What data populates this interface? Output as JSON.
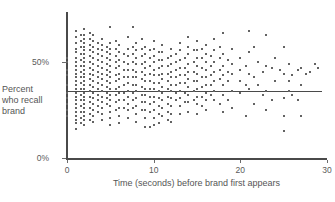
{
  "chart_data": {
    "type": "scatter",
    "title": "",
    "xlabel": "Time (seconds) before brand first appears",
    "ylabel": "Percent who recall brand",
    "xlim": [
      0,
      30
    ],
    "ylim": [
      0,
      75
    ],
    "grid": false,
    "legend": null,
    "xticks": [
      0,
      10,
      20,
      30
    ],
    "xtick_labels": [
      "0",
      "10",
      "20",
      "30"
    ],
    "yticks": [
      0,
      50
    ],
    "ytick_labels": [
      "0%",
      "50%"
    ],
    "annotations": [
      {
        "type": "horizontal-reference-line",
        "y": 35,
        "x_start": 0,
        "x_end": 29.4,
        "label": ""
      }
    ],
    "marker": {
      "shape": "square",
      "size_px": 2,
      "color": "#636363"
    },
    "points": [
      [
        0,
        50
      ],
      [
        0,
        52
      ],
      [
        0,
        46
      ],
      [
        0,
        43
      ],
      [
        0,
        38
      ],
      [
        0,
        34
      ],
      [
        0,
        31
      ],
      [
        0,
        28
      ],
      [
        0,
        25
      ],
      [
        0,
        22
      ],
      [
        1,
        66
      ],
      [
        1,
        63
      ],
      [
        1,
        60
      ],
      [
        1,
        57
      ],
      [
        1,
        55
      ],
      [
        1,
        52
      ],
      [
        1,
        50
      ],
      [
        1,
        48
      ],
      [
        1,
        46
      ],
      [
        1,
        44
      ],
      [
        1,
        42
      ],
      [
        1,
        40
      ],
      [
        1,
        38
      ],
      [
        1,
        36
      ],
      [
        1,
        34
      ],
      [
        1,
        32
      ],
      [
        1,
        30
      ],
      [
        1,
        28
      ],
      [
        1,
        26
      ],
      [
        1,
        24
      ],
      [
        1,
        22
      ],
      [
        1,
        20
      ],
      [
        1,
        18
      ],
      [
        1,
        15
      ],
      [
        1.6,
        64
      ],
      [
        1.6,
        61
      ],
      [
        1.6,
        58
      ],
      [
        1.6,
        54
      ],
      [
        1.6,
        51
      ],
      [
        1.6,
        48
      ],
      [
        1.6,
        45
      ],
      [
        1.6,
        42
      ],
      [
        1.6,
        39
      ],
      [
        1.6,
        36
      ],
      [
        1.6,
        33
      ],
      [
        1.6,
        30
      ],
      [
        1.6,
        27
      ],
      [
        1.6,
        24
      ],
      [
        1.6,
        21
      ],
      [
        1.6,
        18
      ],
      [
        2,
        67
      ],
      [
        2,
        64
      ],
      [
        2,
        62
      ],
      [
        2,
        60
      ],
      [
        2,
        58
      ],
      [
        2,
        56
      ],
      [
        2,
        54
      ],
      [
        2,
        52
      ],
      [
        2,
        50
      ],
      [
        2,
        48
      ],
      [
        2,
        46
      ],
      [
        2,
        44
      ],
      [
        2,
        42
      ],
      [
        2,
        40
      ],
      [
        2,
        38
      ],
      [
        2,
        36
      ],
      [
        2,
        34
      ],
      [
        2,
        32
      ],
      [
        2,
        30
      ],
      [
        2,
        28
      ],
      [
        2,
        26
      ],
      [
        2,
        24
      ],
      [
        2,
        22
      ],
      [
        2,
        20
      ],
      [
        2,
        17
      ],
      [
        2.6,
        65
      ],
      [
        2.6,
        62
      ],
      [
        2.6,
        59
      ],
      [
        2.6,
        56
      ],
      [
        2.6,
        53
      ],
      [
        2.6,
        50
      ],
      [
        2.6,
        47
      ],
      [
        2.6,
        44
      ],
      [
        2.6,
        41
      ],
      [
        2.6,
        38
      ],
      [
        2.6,
        35
      ],
      [
        2.6,
        32
      ],
      [
        2.6,
        29
      ],
      [
        2.6,
        26
      ],
      [
        2.6,
        23
      ],
      [
        2.6,
        20
      ],
      [
        3,
        64
      ],
      [
        3,
        61
      ],
      [
        3,
        58
      ],
      [
        3,
        55
      ],
      [
        3,
        52
      ],
      [
        3,
        49
      ],
      [
        3,
        46
      ],
      [
        3,
        43
      ],
      [
        3,
        40
      ],
      [
        3,
        37
      ],
      [
        3,
        34
      ],
      [
        3,
        31
      ],
      [
        3,
        28
      ],
      [
        3,
        25
      ],
      [
        3,
        22
      ],
      [
        3,
        19
      ],
      [
        3.6,
        60
      ],
      [
        3.6,
        57
      ],
      [
        3.6,
        54
      ],
      [
        3.6,
        51
      ],
      [
        3.6,
        48
      ],
      [
        3.6,
        45
      ],
      [
        3.6,
        42
      ],
      [
        3.6,
        39
      ],
      [
        3.6,
        36
      ],
      [
        3.6,
        33
      ],
      [
        3.6,
        30
      ],
      [
        3.6,
        27
      ],
      [
        3.6,
        24
      ],
      [
        4,
        62
      ],
      [
        4,
        59
      ],
      [
        4,
        56
      ],
      [
        4,
        53
      ],
      [
        4,
        50
      ],
      [
        4,
        47
      ],
      [
        4,
        44
      ],
      [
        4,
        41
      ],
      [
        4,
        38
      ],
      [
        4,
        35
      ],
      [
        4,
        32
      ],
      [
        4,
        29
      ],
      [
        4,
        26
      ],
      [
        4,
        23
      ],
      [
        4,
        20
      ],
      [
        4.6,
        58
      ],
      [
        4.6,
        55
      ],
      [
        4.6,
        52
      ],
      [
        4.6,
        49
      ],
      [
        4.6,
        46
      ],
      [
        4.6,
        43
      ],
      [
        4.6,
        40
      ],
      [
        4.6,
        37
      ],
      [
        4.6,
        34
      ],
      [
        4.6,
        31
      ],
      [
        4.6,
        28
      ],
      [
        5,
        68
      ],
      [
        5,
        60
      ],
      [
        5,
        57
      ],
      [
        5,
        54
      ],
      [
        5,
        51
      ],
      [
        5,
        48
      ],
      [
        5,
        45
      ],
      [
        5,
        42
      ],
      [
        5,
        39
      ],
      [
        5,
        36
      ],
      [
        5,
        33
      ],
      [
        5,
        30
      ],
      [
        5,
        27
      ],
      [
        5,
        24
      ],
      [
        5,
        21
      ],
      [
        5,
        17
      ],
      [
        5.6,
        61
      ],
      [
        5.6,
        57
      ],
      [
        5.6,
        53
      ],
      [
        5.6,
        50
      ],
      [
        5.6,
        47
      ],
      [
        5.6,
        43
      ],
      [
        5.6,
        40
      ],
      [
        5.6,
        36
      ],
      [
        5.6,
        33
      ],
      [
        5.6,
        29
      ],
      [
        5.6,
        25
      ],
      [
        6,
        59
      ],
      [
        6,
        55
      ],
      [
        6,
        51
      ],
      [
        6,
        48
      ],
      [
        6,
        44
      ],
      [
        6,
        41
      ],
      [
        6,
        37
      ],
      [
        6,
        34
      ],
      [
        6,
        30
      ],
      [
        6,
        26
      ],
      [
        6,
        22
      ],
      [
        6,
        18
      ],
      [
        6.6,
        54
      ],
      [
        6.6,
        50
      ],
      [
        6.6,
        46
      ],
      [
        6.6,
        42
      ],
      [
        6.6,
        38
      ],
      [
        6.6,
        34
      ],
      [
        6.6,
        30
      ],
      [
        6.6,
        26
      ],
      [
        7,
        63
      ],
      [
        7,
        57
      ],
      [
        7,
        53
      ],
      [
        7,
        49
      ],
      [
        7,
        46
      ],
      [
        7,
        42
      ],
      [
        7,
        39
      ],
      [
        7,
        35
      ],
      [
        7,
        32
      ],
      [
        7,
        28
      ],
      [
        7,
        25
      ],
      [
        7,
        21
      ],
      [
        7.6,
        68
      ],
      [
        7.6,
        58
      ],
      [
        7.6,
        54
      ],
      [
        7.6,
        50
      ],
      [
        7.6,
        46
      ],
      [
        7.6,
        42
      ],
      [
        7.6,
        38
      ],
      [
        7.6,
        34
      ],
      [
        7.6,
        30
      ],
      [
        7.6,
        26
      ],
      [
        8,
        60
      ],
      [
        8,
        56
      ],
      [
        8,
        52
      ],
      [
        8,
        49
      ],
      [
        8,
        45
      ],
      [
        8,
        42
      ],
      [
        8,
        38
      ],
      [
        8,
        35
      ],
      [
        8,
        31
      ],
      [
        8,
        27
      ],
      [
        8,
        23
      ],
      [
        8,
        19
      ],
      [
        8.6,
        62
      ],
      [
        8.6,
        57
      ],
      [
        8.6,
        53
      ],
      [
        8.6,
        49
      ],
      [
        8.6,
        45
      ],
      [
        8.6,
        41
      ],
      [
        8.6,
        37
      ],
      [
        8.6,
        33
      ],
      [
        8.6,
        29
      ],
      [
        8.6,
        25
      ],
      [
        9,
        58
      ],
      [
        9,
        54
      ],
      [
        9,
        50
      ],
      [
        9,
        47
      ],
      [
        9,
        43
      ],
      [
        9,
        40
      ],
      [
        9,
        36
      ],
      [
        9,
        33
      ],
      [
        9,
        29
      ],
      [
        9,
        25
      ],
      [
        9,
        21
      ],
      [
        9,
        16
      ],
      [
        9.6,
        56
      ],
      [
        9.6,
        52
      ],
      [
        9.6,
        48
      ],
      [
        9.6,
        44
      ],
      [
        9.6,
        40
      ],
      [
        9.6,
        36
      ],
      [
        9.6,
        32
      ],
      [
        9.6,
        28
      ],
      [
        9.6,
        24
      ],
      [
        9.6,
        16
      ],
      [
        10,
        61
      ],
      [
        10,
        57
      ],
      [
        10,
        53
      ],
      [
        10,
        50
      ],
      [
        10,
        46
      ],
      [
        10,
        43
      ],
      [
        10,
        39
      ],
      [
        10,
        36
      ],
      [
        10,
        32
      ],
      [
        10,
        29
      ],
      [
        10,
        25
      ],
      [
        10,
        21
      ],
      [
        10,
        17
      ],
      [
        10.6,
        55
      ],
      [
        10.6,
        51
      ],
      [
        10.6,
        47
      ],
      [
        10.6,
        43
      ],
      [
        10.6,
        39
      ],
      [
        10.6,
        35
      ],
      [
        10.6,
        31
      ],
      [
        10.6,
        27
      ],
      [
        10.6,
        23
      ],
      [
        10.6,
        18
      ],
      [
        11,
        59
      ],
      [
        11,
        55
      ],
      [
        11,
        51
      ],
      [
        11,
        48
      ],
      [
        11,
        44
      ],
      [
        11,
        41
      ],
      [
        11,
        37
      ],
      [
        11,
        34
      ],
      [
        11,
        30
      ],
      [
        11,
        26
      ],
      [
        11,
        22
      ],
      [
        11.6,
        52
      ],
      [
        11.6,
        48
      ],
      [
        11.6,
        44
      ],
      [
        11.6,
        40
      ],
      [
        11.6,
        36
      ],
      [
        11.6,
        32
      ],
      [
        11.6,
        28
      ],
      [
        11.6,
        24
      ],
      [
        11.6,
        20
      ],
      [
        12,
        57
      ],
      [
        12,
        53
      ],
      [
        12,
        49
      ],
      [
        12,
        45
      ],
      [
        12,
        42
      ],
      [
        12,
        38
      ],
      [
        12,
        35
      ],
      [
        12,
        31
      ],
      [
        12,
        27
      ],
      [
        12,
        23
      ],
      [
        12,
        19
      ],
      [
        12.6,
        54
      ],
      [
        12.6,
        50
      ],
      [
        12.6,
        46
      ],
      [
        12.6,
        42
      ],
      [
        12.6,
        38
      ],
      [
        12.6,
        34
      ],
      [
        12.6,
        30
      ],
      [
        13,
        60
      ],
      [
        13,
        56
      ],
      [
        13,
        51
      ],
      [
        13,
        47
      ],
      [
        13,
        43
      ],
      [
        13,
        39
      ],
      [
        13,
        35
      ],
      [
        13,
        31
      ],
      [
        13,
        27
      ],
      [
        13,
        23
      ],
      [
        13.6,
        52
      ],
      [
        13.6,
        47
      ],
      [
        13.6,
        43
      ],
      [
        13.6,
        39
      ],
      [
        13.6,
        34
      ],
      [
        13.6,
        29
      ],
      [
        14,
        63
      ],
      [
        14,
        58
      ],
      [
        14,
        54
      ],
      [
        14,
        49
      ],
      [
        14,
        45
      ],
      [
        14,
        41
      ],
      [
        14,
        37
      ],
      [
        14,
        33
      ],
      [
        14,
        29
      ],
      [
        14,
        24
      ],
      [
        14.6,
        56
      ],
      [
        14.6,
        50
      ],
      [
        14.6,
        45
      ],
      [
        14.6,
        40
      ],
      [
        14.6,
        35
      ],
      [
        14.6,
        30
      ],
      [
        15,
        61
      ],
      [
        15,
        56
      ],
      [
        15,
        52
      ],
      [
        15,
        48
      ],
      [
        15,
        44
      ],
      [
        15,
        40
      ],
      [
        15,
        36
      ],
      [
        15,
        32
      ],
      [
        15,
        28
      ],
      [
        15,
        23
      ],
      [
        15.6,
        57
      ],
      [
        15.6,
        52
      ],
      [
        15.6,
        47
      ],
      [
        15.6,
        42
      ],
      [
        15.6,
        37
      ],
      [
        15.6,
        32
      ],
      [
        15.6,
        27
      ],
      [
        16,
        59
      ],
      [
        16,
        54
      ],
      [
        16,
        50
      ],
      [
        16,
        46
      ],
      [
        16,
        42
      ],
      [
        16,
        38
      ],
      [
        16,
        34
      ],
      [
        16,
        30
      ],
      [
        16,
        25
      ],
      [
        16.6,
        53
      ],
      [
        16.6,
        48
      ],
      [
        16.6,
        43
      ],
      [
        16.6,
        38
      ],
      [
        16.6,
        33
      ],
      [
        17,
        62
      ],
      [
        17,
        56
      ],
      [
        17,
        50
      ],
      [
        17,
        45
      ],
      [
        17,
        40
      ],
      [
        17,
        35
      ],
      [
        17,
        30
      ],
      [
        17.6,
        58
      ],
      [
        17.6,
        52
      ],
      [
        17.6,
        46
      ],
      [
        17.6,
        41
      ],
      [
        17.6,
        28
      ],
      [
        18,
        65
      ],
      [
        18,
        54
      ],
      [
        18,
        48
      ],
      [
        18,
        43
      ],
      [
        18,
        38
      ],
      [
        18,
        33
      ],
      [
        18,
        24
      ],
      [
        18.6,
        51
      ],
      [
        18.6,
        45
      ],
      [
        18.6,
        40
      ],
      [
        18.6,
        30
      ],
      [
        19,
        57
      ],
      [
        19,
        49
      ],
      [
        19,
        44
      ],
      [
        19,
        35
      ],
      [
        19,
        26
      ],
      [
        20,
        52
      ],
      [
        20,
        46
      ],
      [
        20,
        40
      ],
      [
        20,
        34
      ],
      [
        20.6,
        48
      ],
      [
        20.6,
        38
      ],
      [
        20.6,
        22
      ],
      [
        21,
        66
      ],
      [
        21,
        55
      ],
      [
        21,
        44
      ],
      [
        21,
        36
      ],
      [
        21.6,
        58
      ],
      [
        21.6,
        42
      ],
      [
        21.6,
        28
      ],
      [
        22,
        50
      ],
      [
        22,
        38
      ],
      [
        22.6,
        45
      ],
      [
        22.6,
        33
      ],
      [
        23,
        64
      ],
      [
        23,
        48
      ],
      [
        23,
        35
      ],
      [
        23,
        25
      ],
      [
        23.6,
        47
      ],
      [
        23.6,
        30
      ],
      [
        24,
        52
      ],
      [
        24,
        40
      ],
      [
        24.6,
        46
      ],
      [
        25,
        58
      ],
      [
        25,
        44
      ],
      [
        25,
        31
      ],
      [
        25,
        22
      ],
      [
        25,
        14
      ],
      [
        25.6,
        49
      ],
      [
        25.6,
        40
      ],
      [
        25.6,
        35
      ],
      [
        26,
        43
      ],
      [
        26,
        33
      ],
      [
        26.6,
        46
      ],
      [
        26.6,
        30
      ],
      [
        27,
        47
      ],
      [
        27,
        38
      ],
      [
        27,
        22
      ],
      [
        27.6,
        44
      ],
      [
        28,
        45
      ],
      [
        28.6,
        49
      ],
      [
        29,
        47
      ]
    ]
  }
}
